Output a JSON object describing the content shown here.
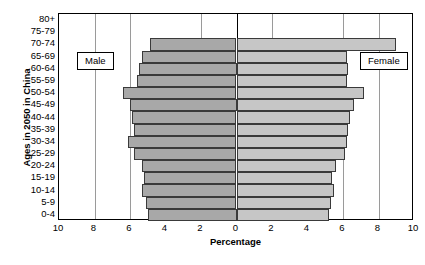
{
  "chart_data": {
    "type": "bar",
    "subtype": "population-pyramid",
    "title": "",
    "xlabel": "Percentage",
    "ylabel": "Ages in 2050 in China",
    "categories": [
      "80+",
      "75-79",
      "70-74",
      "65-69",
      "60-64",
      "55-59",
      "50-54",
      "45-49",
      "40-44",
      "35-39",
      "30-34",
      "25-29",
      "20-24",
      "15-19",
      "10-14",
      "5-9",
      "0-4"
    ],
    "series": [
      {
        "name": "Male",
        "side": "left",
        "values": [
          0.0,
          0.0,
          4.9,
          5.3,
          5.5,
          5.6,
          6.4,
          6.0,
          5.9,
          5.8,
          6.1,
          5.8,
          5.3,
          5.2,
          5.3,
          5.1,
          5.0
        ]
      },
      {
        "name": "Female",
        "side": "right",
        "values": [
          0.0,
          0.0,
          9.0,
          6.2,
          6.3,
          6.2,
          7.2,
          6.6,
          6.4,
          6.3,
          6.2,
          6.1,
          5.6,
          5.4,
          5.5,
          5.3,
          5.2
        ]
      }
    ],
    "xticks_left": [
      10,
      8,
      6,
      4,
      2
    ],
    "xticks_right": [
      2,
      4,
      6,
      8,
      10
    ],
    "xtick_labels": [
      "10",
      "8",
      "6",
      "4",
      "2",
      "0",
      "2",
      "4",
      "6",
      "8",
      "10"
    ],
    "xlim": [
      -10,
      10
    ],
    "axis_max": 10,
    "gridlines_at": [
      8,
      6,
      2
    ],
    "zero_gridline": 0,
    "grid": true,
    "legend_position": "inside-plot",
    "colors": {
      "male_bar": "#a8a8a8",
      "female_bar": "#c6c6c6",
      "bar_border": "#3a3a3a",
      "gridline": "#9a9a9a",
      "axis": "#000000",
      "background": "#ffffff"
    }
  },
  "legend": {
    "male_label": "Male",
    "female_label": "Female"
  }
}
